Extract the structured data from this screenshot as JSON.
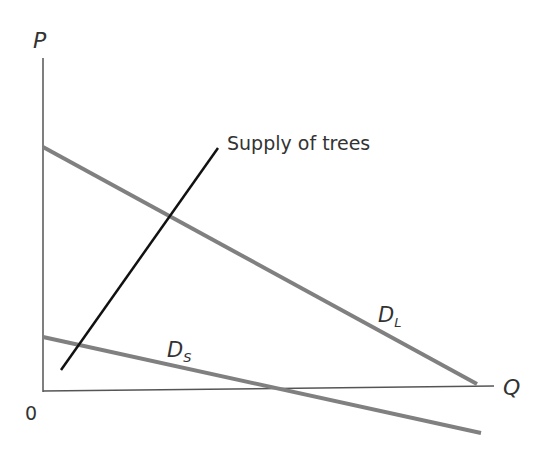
{
  "diagram": {
    "axes": {
      "y_label": "P",
      "x_label": "Q",
      "origin_label": "0",
      "color": "#555555"
    },
    "curves": [
      {
        "id": "supply",
        "label": "Supply of trees",
        "color": "#111111",
        "x1": 61,
        "y1": 370,
        "x2": 218,
        "y2": 148
      },
      {
        "id": "demand_long",
        "label_main": "D",
        "label_sub": "L",
        "color": "#808080",
        "x1": 43,
        "y1": 147,
        "x2": 477,
        "y2": 384
      },
      {
        "id": "demand_short",
        "label_main": "D",
        "label_sub": "S",
        "color": "#808080",
        "x1": 43,
        "y1": 337,
        "x2": 481,
        "y2": 433
      }
    ]
  }
}
